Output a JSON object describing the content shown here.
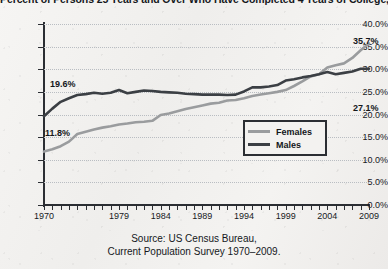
{
  "chart_data": {
    "type": "line",
    "title": "Percent of Persons 25 Years and Over Who Have Completed 4 Years of College, 1970–2009, by Sex",
    "xlabel": "",
    "ylabel": "",
    "ylim": [
      0,
      40
    ],
    "xlim": [
      1970,
      2009
    ],
    "grid": true,
    "legend_position": "inside-right",
    "y_ticks": [
      "0.0%",
      "5.0%",
      "10.0%",
      "15.0%",
      "20.0%",
      "25.0%",
      "30.0%",
      "35.0%",
      "40.0%"
    ],
    "y_tick_values": [
      0,
      5,
      10,
      15,
      20,
      25,
      30,
      35,
      40
    ],
    "x_tick_labels": [
      "1970",
      "1979",
      "1984",
      "1989",
      "1994",
      "1999",
      "2004",
      "2009"
    ],
    "x_tick_values": [
      1970,
      1979,
      1984,
      1989,
      1994,
      1999,
      2004,
      2009
    ],
    "x": [
      1970,
      1971,
      1972,
      1973,
      1974,
      1975,
      1976,
      1977,
      1978,
      1979,
      1980,
      1981,
      1982,
      1983,
      1984,
      1985,
      1986,
      1987,
      1988,
      1989,
      1990,
      1991,
      1992,
      1993,
      1994,
      1995,
      1996,
      1997,
      1998,
      1999,
      2000,
      2001,
      2002,
      2003,
      2004,
      2005,
      2006,
      2007,
      2008,
      2009
    ],
    "series": [
      {
        "name": "Females",
        "color": "#9a9c9e",
        "values": [
          11.8,
          12.3,
          13.0,
          14.0,
          15.7,
          16.2,
          16.7,
          17.1,
          17.4,
          17.8,
          18.0,
          18.3,
          18.4,
          18.6,
          19.9,
          20.2,
          20.7,
          21.2,
          21.6,
          22.0,
          22.4,
          22.6,
          23.1,
          23.2,
          23.6,
          24.1,
          24.4,
          24.7,
          25.0,
          25.4,
          26.3,
          27.3,
          28.4,
          28.9,
          30.4,
          30.9,
          31.3,
          32.5,
          34.2,
          35.7
        ],
        "start_label": "11.8%",
        "end_label": "35.7%"
      },
      {
        "name": "Males",
        "color": "#3b3f44",
        "values": [
          19.6,
          21.3,
          22.8,
          23.6,
          24.3,
          24.5,
          24.8,
          24.6,
          24.8,
          25.4,
          24.7,
          25.0,
          25.3,
          25.2,
          25.0,
          24.9,
          24.8,
          24.6,
          24.5,
          24.4,
          24.4,
          24.4,
          24.3,
          24.4,
          25.1,
          26.0,
          26.0,
          26.2,
          26.5,
          27.5,
          27.8,
          28.2,
          28.5,
          28.9,
          29.4,
          28.9,
          29.2,
          29.5,
          30.1,
          30.1
        ],
        "start_label": "19.6%",
        "end_label": "27.1%"
      }
    ],
    "point_labels": [
      {
        "text": "19.6%",
        "x_px": 50,
        "y_px": 79
      },
      {
        "text": "11.8%",
        "x_px": 45,
        "y_px": 128
      },
      {
        "text": "35.7%",
        "x_px": 353,
        "y_px": 36
      },
      {
        "text": "27.1%",
        "x_px": 353,
        "y_px": 103
      }
    ],
    "legend": [
      {
        "label": "Females",
        "color": "#9a9c9e"
      },
      {
        "label": "Males",
        "color": "#3b3f44"
      }
    ],
    "source": {
      "line1": "Source: US Census Bureau,",
      "line2": "Current Population Survey 1970–2009."
    }
  }
}
